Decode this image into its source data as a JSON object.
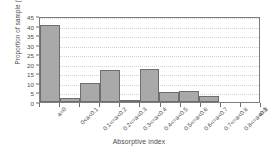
{
  "chart_data": {
    "type": "bar",
    "title": "",
    "xlabel": "Absorptive index",
    "ylabel": "Proportion of sample (%)",
    "categories": [
      "a=0",
      "0<a<0.1",
      "0.1<=a<0.2",
      "0.2<=a<0.3",
      "0.3<=a<0.4",
      "0.4<=a<0.5",
      "0.5<=a<0.6",
      "0.6<=a<0.7",
      "0.7<=a<0.8",
      "0.8<=a<0.9",
      "a=1"
    ],
    "values": [
      40.3,
      2.0,
      10.1,
      16.8,
      1.0,
      17.4,
      5.5,
      6.0,
      3.0,
      0,
      0
    ],
    "ylim": [
      0,
      45
    ],
    "yticks": [
      0,
      5,
      10,
      15,
      20,
      25,
      30,
      35,
      40,
      45
    ],
    "ytick_labels": [
      "0",
      "5",
      "10",
      "15",
      "20",
      "25",
      "30",
      "35",
      "40",
      "45"
    ],
    "grid": true,
    "grid_axis": "y",
    "legend": false,
    "bar_color": "#a9a9a9",
    "bar_edge_color": "#6e6e6e",
    "grid_color": "#d2d2d2",
    "axis_color": "#7d7d7d",
    "text_color": "#4a4a4a",
    "background": "#ffffff"
  }
}
